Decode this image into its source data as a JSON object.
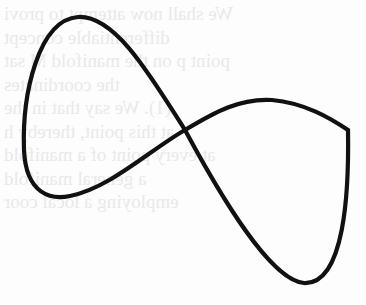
{
  "page": {
    "type": "scanned-book-figure",
    "background_color": "#fdfdfd",
    "stroke_color": "#111111"
  },
  "figure": {
    "crossing_point": [
      185,
      130
    ],
    "corner_point": [
      348,
      130
    ],
    "path": "M 185 130 C 150 75, 115 15, 78 17 C 38 20, 22 95, 24 150 C 26 195, 52 200, 70 196 C 110 188, 150 150, 185 130 C 215 112, 240 98, 272 100 C 305 103, 330 118, 348 130 C 349 190, 345 285, 304 283 C 270 280, 220 195, 185 130 Z"
  },
  "bleed_through_text": {
    "note": "faint mirrored text from reverse side of scanned page",
    "lines": [
      "We shall now attempt to provi",
      "differentiable concept",
      "point p on the manifold M sat",
      "the coordinates",
      "(1). We say that in the",
      "at this point, thereby h",
      "at every point of a manifold",
      "a general manifold",
      "employing a local coor",
      "",
      "",
      "",
      ""
    ]
  }
}
